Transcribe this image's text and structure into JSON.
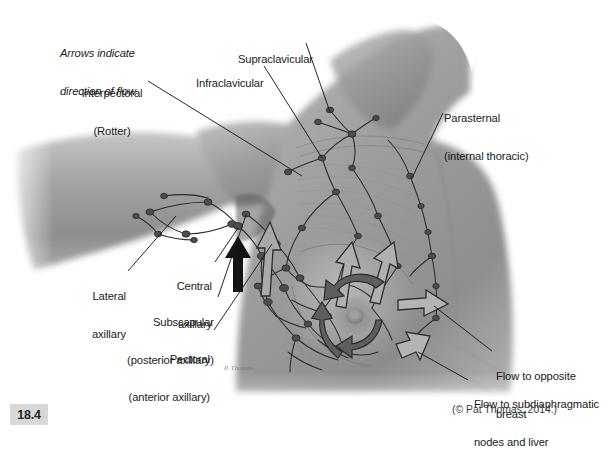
{
  "figure": {
    "number": "18.4",
    "credit": "(© Pat Thomas, 2014.)",
    "note": "Arrows indicate\ndirection of flow",
    "note_line1": "Arrows indicate",
    "note_line2": "direction of flow",
    "signature": "P. Thomas"
  },
  "labels": {
    "interpectoral": {
      "line1": "Interpectoral",
      "line2": "(Rotter)"
    },
    "supraclavicular": {
      "line1": "Supraclavicular"
    },
    "infraclavicular": {
      "line1": "Infraclavicular"
    },
    "parasternal": {
      "line1": "Parasternal",
      "line2": "(internal thoracic)"
    },
    "lateral": {
      "line1": "Lateral",
      "line2": "axillary"
    },
    "central": {
      "line1": "Central",
      "line2": "axillary"
    },
    "subscapular": {
      "line1": "Subscapular",
      "line2": "(posterior axillary)"
    },
    "pectoral": {
      "line1": "Pectoral",
      "line2": "(anterior axillary)"
    },
    "flow_opposite": {
      "line1": "Flow to opposite",
      "line2": "breast"
    },
    "flow_subdiaphragmatic": {
      "line1": "Flow to subdiaphragmatic",
      "line2": "nodes and liver"
    }
  },
  "colors": {
    "background": "#ffffff",
    "skin_mid": "#9a9a9a",
    "skin_light": "#bdbdbd",
    "skin_dark": "#6d6d6d",
    "line": "#1a1a1a",
    "text": "#1a1a1a",
    "fignum_bg": "#d8d8d8",
    "arrow_solid": "#5b5b5b",
    "arrow_hollow_fill": "#b4b4b4"
  },
  "diagram": {
    "type": "anatomical-illustration",
    "view": "anterior, right breast with arm abducted",
    "node_groups": [
      "Supraclavicular",
      "Infraclavicular",
      "Interpectoral (Rotter)",
      "Parasternal (internal thoracic)",
      "Lateral axillary",
      "Central axillary",
      "Subscapular (posterior axillary)",
      "Pectoral (anterior axillary)"
    ],
    "flow_arrows": {
      "solid": "lymph flow within breast toward axilla",
      "hollow": "lymph flow to opposite breast and to subdiaphragmatic nodes and liver"
    }
  }
}
